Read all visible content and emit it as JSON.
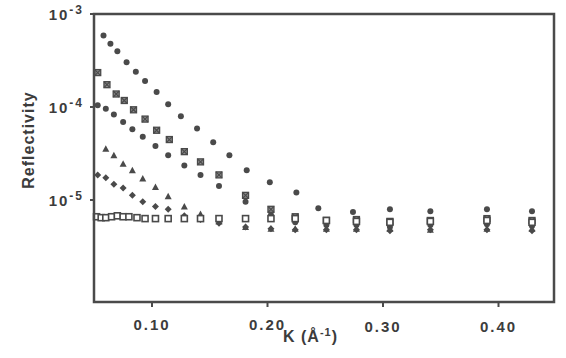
{
  "chart_data": {
    "type": "scatter",
    "title": "",
    "xlabel": "K (Å-1)",
    "xlabel_parts": {
      "main": "K (Å",
      "sup": "-1",
      "close": ")"
    },
    "ylabel": "Reflectivity",
    "xlim": [
      0.05,
      0.449
    ],
    "ylim_log10": [
      -6.1,
      -3
    ],
    "yscale": "log",
    "grid": false,
    "legend": "none",
    "x_ticks": [
      {
        "value": 0.1,
        "label": "0.10"
      },
      {
        "value": 0.2,
        "label": "0.20"
      },
      {
        "value": 0.3,
        "label": "0.30"
      },
      {
        "value": 0.4,
        "label": "0.40"
      }
    ],
    "y_ticks": [
      {
        "log": -3,
        "base": "10",
        "exp": "-3"
      },
      {
        "log": -4,
        "base": "10",
        "exp": "-4"
      },
      {
        "log": -5,
        "base": "10",
        "exp": "-5"
      }
    ],
    "series": [
      {
        "name": "filled circles (top)",
        "marker": "circle",
        "x": [
          0.058,
          0.064,
          0.07,
          0.078,
          0.086,
          0.094,
          0.104,
          0.114,
          0.125,
          0.139,
          0.153,
          0.167,
          0.182,
          0.202,
          0.225,
          0.244,
          0.274,
          0.306,
          0.341,
          0.39,
          0.429
        ],
        "log10_y": [
          -3.23,
          -3.32,
          -3.4,
          -3.52,
          -3.62,
          -3.72,
          -3.84,
          -3.97,
          -4.1,
          -4.23,
          -4.38,
          -4.52,
          -4.68,
          -4.81,
          -4.92,
          -5.09,
          -5.13,
          -5.1,
          -5.12,
          -5.1,
          -5.12
        ]
      },
      {
        "name": "crossed squares",
        "marker": "crossed-square",
        "x": [
          0.053,
          0.061,
          0.069,
          0.076,
          0.084,
          0.094,
          0.104,
          0.115,
          0.128,
          0.142,
          0.158,
          0.181,
          0.203,
          0.224,
          0.251,
          0.277,
          0.306,
          0.341,
          0.39,
          0.429
        ],
        "log10_y": [
          -3.63,
          -3.76,
          -3.86,
          -3.93,
          -4.03,
          -4.13,
          -4.25,
          -4.35,
          -4.48,
          -4.59,
          -4.73,
          -4.95,
          -5.1,
          -5.18,
          -5.22,
          -5.21,
          -5.23,
          -5.22,
          -5.2,
          -5.22
        ]
      },
      {
        "name": "filled circles (middle)",
        "marker": "circle",
        "x": [
          0.053,
          0.06,
          0.067,
          0.075,
          0.083,
          0.092,
          0.103,
          0.114,
          0.128,
          0.142,
          0.158,
          0.181,
          0.203,
          0.224,
          0.251,
          0.277,
          0.306,
          0.341,
          0.39,
          0.429
        ],
        "log10_y": [
          -3.98,
          -4.02,
          -4.08,
          -4.16,
          -4.24,
          -4.32,
          -4.42,
          -4.52,
          -4.63,
          -4.73,
          -4.85,
          -5.02,
          -5.16,
          -5.24,
          -5.27,
          -5.27,
          -5.29,
          -5.27,
          -5.26,
          -5.28
        ]
      },
      {
        "name": "triangles",
        "marker": "triangle",
        "x": [
          0.06,
          0.067,
          0.075,
          0.083,
          0.092,
          0.103,
          0.114,
          0.128,
          0.142,
          0.158,
          0.181,
          0.203,
          0.224,
          0.251,
          0.277,
          0.306,
          0.341,
          0.39,
          0.429
        ],
        "log10_y": [
          -4.45,
          -4.52,
          -4.61,
          -4.68,
          -4.77,
          -4.86,
          -4.96,
          -5.07,
          -5.15,
          -5.23,
          -5.29,
          -5.31,
          -5.31,
          -5.31,
          -5.31,
          -5.31,
          -5.32,
          -5.31,
          -5.31
        ]
      },
      {
        "name": "diamonds",
        "marker": "diamond",
        "x": [
          0.053,
          0.06,
          0.067,
          0.075,
          0.083,
          0.092,
          0.103,
          0.114,
          0.128,
          0.142,
          0.158,
          0.181,
          0.203,
          0.224,
          0.251,
          0.277,
          0.306,
          0.341,
          0.39,
          0.429
        ],
        "log10_y": [
          -4.73,
          -4.76,
          -4.83,
          -4.87,
          -4.95,
          -5.02,
          -5.07,
          -5.1,
          -5.17,
          -5.21,
          -5.25,
          -5.29,
          -5.31,
          -5.32,
          -5.32,
          -5.32,
          -5.33,
          -5.32,
          -5.32,
          -5.33
        ]
      },
      {
        "name": "open squares",
        "marker": "open-square",
        "x": [
          0.052,
          0.056,
          0.06,
          0.065,
          0.07,
          0.075,
          0.08,
          0.087,
          0.094,
          0.103,
          0.114,
          0.128,
          0.142,
          0.158,
          0.181,
          0.203,
          0.224,
          0.251,
          0.277,
          0.306,
          0.341,
          0.39,
          0.429
        ],
        "log10_y": [
          -5.18,
          -5.19,
          -5.19,
          -5.18,
          -5.17,
          -5.18,
          -5.18,
          -5.19,
          -5.2,
          -5.2,
          -5.2,
          -5.2,
          -5.2,
          -5.2,
          -5.2,
          -5.2,
          -5.2,
          -5.22,
          -5.23,
          -5.24,
          -5.23,
          -5.22,
          -5.24
        ]
      }
    ]
  }
}
